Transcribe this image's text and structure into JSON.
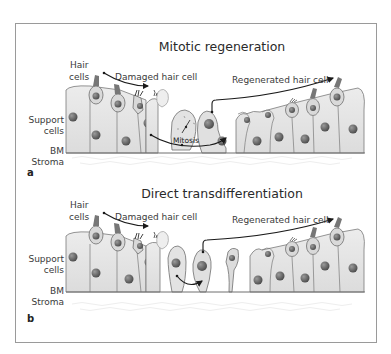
{
  "figure": {
    "frame": {
      "stroke": "#9a9a9a"
    },
    "colors": {
      "cell_fill": "#e6e6e6",
      "cell_stroke": "#6e6e6e",
      "nucleus": "#5c5c5c",
      "bundle": "#707070",
      "arrow": "#1a1a1a"
    }
  },
  "panels": [
    {
      "letter": "a",
      "title": "Mitotic regeneration",
      "labels": {
        "hair_cells_1": "Hair",
        "hair_cells_2": "cells",
        "damaged": "Damaged hair cell",
        "regenerated": "Regenerated hair cell",
        "support_1": "Support",
        "support_2": "cells",
        "bm": "BM",
        "stroma": "Stroma",
        "mitosis": "Mitosis"
      }
    },
    {
      "letter": "b",
      "title": "Direct transdifferentiation",
      "labels": {
        "hair_cells_1": "Hair",
        "hair_cells_2": "cells",
        "damaged": "Damaged hair cell",
        "regenerated": "Regenerated hair cell",
        "support_1": "Support",
        "support_2": "cells",
        "bm": "BM",
        "stroma": "Stroma"
      }
    }
  ]
}
